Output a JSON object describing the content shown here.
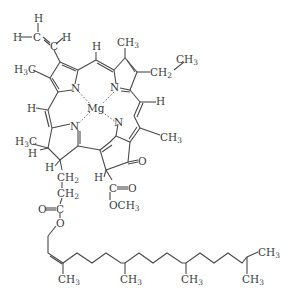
{
  "diagram": {
    "type": "chemical-structure",
    "molecule": "chlorophyll a",
    "central_atom": "Mg",
    "labels": {
      "vinyl_h_top": "H",
      "vinyl_h_left": "H",
      "vinyl_c1": "C",
      "vinyl_c2": "C",
      "vinyl_h_right": "H",
      "h3c_ringA": "H",
      "h3c_ringA_sub": "3",
      "h3c_ringA_c": "C",
      "meso_h_top": "H",
      "ch3_ringB": "CH",
      "ch3_ringB_sub": "3",
      "ch2_ethyl": "CH",
      "ch2_ethyl_sub": "2",
      "ch3_ethyl": "CH",
      "ch3_ethyl_sub": "3",
      "n1": "N",
      "n2": "N",
      "n3": "N",
      "n4": "N",
      "mg": "Mg",
      "meso_h_left": "H",
      "meso_h_right": "H",
      "ch3_ringC": "CH",
      "ch3_ringC_sub": "3",
      "h3c_ringD": "H",
      "h3c_ringD_sub": "3",
      "h3c_ringD_c": "C",
      "h_ringD_1": "H",
      "h_ringD_2": "H",
      "ch2_a": "CH",
      "ch2_a_sub": "2",
      "ch2_b": "CH",
      "ch2_b_sub": "2",
      "ester_o_double": "O",
      "ester_c": "C",
      "ester_o": "O",
      "ketone_o": "O",
      "h_ringE": "H",
      "carbonyl_c": "C",
      "carbonyl_o": "O",
      "och3": "OCH",
      "och3_sub": "3",
      "phytyl_ch3_1": "CH",
      "phytyl_ch3_2": "CH",
      "phytyl_ch3_3": "CH",
      "phytyl_ch3_4": "CH",
      "phytyl_ch3_5": "CH",
      "phytyl_sub": "3"
    }
  }
}
